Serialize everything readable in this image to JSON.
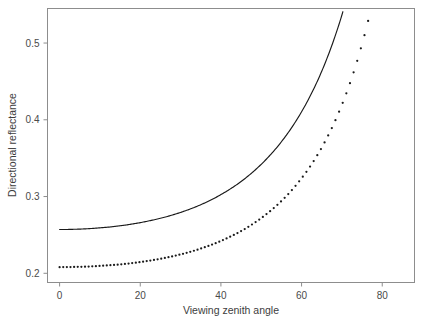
{
  "chart_data": {
    "type": "line",
    "title": "",
    "xlabel": "Viewing zenith angle",
    "ylabel": "Directional reflectance",
    "xlim": [
      -3,
      88
    ],
    "ylim": [
      0.188,
      0.545
    ],
    "grid": false,
    "legend": "none",
    "xticks": [
      0,
      20,
      40,
      60,
      80
    ],
    "xtick_labels": [
      "0",
      "20",
      "40",
      "60",
      "80"
    ],
    "yticks": [
      0.2,
      0.3,
      0.4,
      0.5
    ],
    "ytick_labels": [
      "0.2",
      "0.3",
      "0.4",
      "0.5"
    ],
    "series": [
      {
        "name": "upper-solid-curve",
        "style": "solid-line",
        "color": "#1a1a1a",
        "x": [
          0,
          2,
          4,
          6,
          8,
          10,
          12,
          14,
          16,
          18,
          20,
          22,
          24,
          26,
          28,
          30,
          32,
          34,
          36,
          38,
          40,
          42,
          44,
          46,
          48,
          50,
          52,
          54,
          56,
          58,
          60,
          62,
          64,
          66,
          68,
          70,
          72,
          74,
          76,
          78,
          80,
          82,
          84,
          85
        ],
        "y": [
          0.257,
          0.2571,
          0.2574,
          0.2578,
          0.2584,
          0.2592,
          0.2601,
          0.2613,
          0.2626,
          0.2642,
          0.266,
          0.2681,
          0.2704,
          0.273,
          0.276,
          0.2793,
          0.283,
          0.2871,
          0.2917,
          0.2968,
          0.3025,
          0.3088,
          0.3158,
          0.3236,
          0.3323,
          0.342,
          0.3528,
          0.3648,
          0.3783,
          0.3934,
          0.4104,
          0.4296,
          0.4513,
          0.476,
          0.5042,
          0.5365,
          0.5735,
          0.6161,
          0.6653,
          0.7224,
          0.7889,
          0.8668,
          0.9583,
          1.0095
        ]
      },
      {
        "name": "lower-dotted-series",
        "style": "dotted-points",
        "color": "#1a1a1a",
        "x": [
          0,
          2,
          4,
          6,
          8,
          10,
          12,
          14,
          16,
          18,
          20,
          22,
          24,
          26,
          28,
          30,
          32,
          34,
          36,
          38,
          40,
          42,
          44,
          46,
          48,
          50,
          52,
          54,
          56,
          58,
          60,
          62,
          64,
          66,
          68,
          70,
          72,
          74,
          76,
          78,
          80,
          82,
          84,
          85
        ],
        "y": [
          0.208,
          0.2081,
          0.2083,
          0.2086,
          0.209,
          0.2096,
          0.2103,
          0.2111,
          0.2121,
          0.2133,
          0.2146,
          0.2162,
          0.2179,
          0.2199,
          0.2221,
          0.2246,
          0.2274,
          0.2305,
          0.234,
          0.2378,
          0.2421,
          0.2469,
          0.2522,
          0.258,
          0.2646,
          0.2719,
          0.2801,
          0.2892,
          0.2994,
          0.3109,
          0.3238,
          0.3383,
          0.3547,
          0.3735,
          0.3949,
          0.4195,
          0.4477,
          0.4804,
          0.5184,
          0.5628,
          0.6149,
          0.6766,
          0.75,
          0.7916
        ]
      }
    ]
  }
}
